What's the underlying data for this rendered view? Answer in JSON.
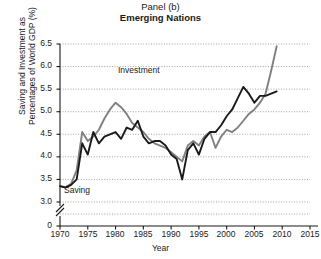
{
  "title": {
    "panel": "Panel (b)",
    "subtitle": "Emerging Nations"
  },
  "axes": {
    "ylabel_line1": "Saving and Investment as",
    "ylabel_line2": "Percentages of World GDP (%)",
    "xlabel": "Year",
    "yticks": [
      "6.5",
      "6.0",
      "5.5",
      "5.0",
      "4.5",
      "4.0",
      "3.5",
      "3.0",
      "0"
    ],
    "xticks": [
      "1970",
      "1975",
      "1980",
      "1985",
      "1990",
      "1995",
      "2000",
      "2005",
      "2010",
      "2015"
    ],
    "axis_break": true
  },
  "series_labels": {
    "investment": "Investment",
    "saving": "Saving"
  },
  "colors": {
    "saving": "#1a1a1a",
    "investment": "#808080",
    "grid": "#999999",
    "axis": "#1a1a1a",
    "background": "#ffffff"
  },
  "chart_data": {
    "type": "line",
    "title": "Panel (b) Emerging Nations",
    "xlabel": "Year",
    "ylabel": "Saving and Investment as Percentages of World GDP (%)",
    "xlim": [
      1970,
      2015
    ],
    "ylim": [
      3.0,
      6.5
    ],
    "ytick_values": [
      3.0,
      3.5,
      4.0,
      4.5,
      5.0,
      5.5,
      6.0,
      6.5
    ],
    "xtick_values": [
      1970,
      1975,
      1980,
      1985,
      1990,
      1995,
      2000,
      2005,
      2010,
      2015
    ],
    "grid": "horizontal-dotted",
    "legend": "inline-annotations",
    "axis_break_below": 3.0,
    "x": [
      1970,
      1971,
      1972,
      1973,
      1974,
      1975,
      1976,
      1977,
      1978,
      1979,
      1980,
      1981,
      1982,
      1983,
      1984,
      1985,
      1986,
      1987,
      1988,
      1989,
      1990,
      1991,
      1992,
      1993,
      1994,
      1995,
      1996,
      1997,
      1998,
      1999,
      2000,
      2001,
      2002,
      2003,
      2004,
      2005,
      2006,
      2007,
      2008,
      2009
    ],
    "series": [
      {
        "name": "Saving",
        "color": "#1a1a1a",
        "values": [
          3.35,
          3.32,
          3.38,
          3.5,
          4.3,
          4.05,
          4.55,
          4.3,
          4.45,
          4.5,
          4.55,
          4.4,
          4.65,
          4.6,
          4.8,
          4.45,
          4.3,
          4.35,
          4.35,
          4.25,
          4.05,
          3.95,
          3.5,
          4.15,
          4.3,
          4.05,
          4.4,
          4.55,
          4.55,
          4.7,
          4.9,
          5.05,
          5.3,
          5.55,
          5.4,
          5.2,
          5.35,
          5.35,
          5.4,
          5.45
        ]
      },
      {
        "name": "Investment",
        "color": "#808080",
        "values": [
          3.35,
          3.33,
          3.4,
          3.7,
          4.55,
          4.35,
          4.45,
          4.6,
          4.85,
          5.05,
          5.2,
          5.1,
          4.95,
          4.75,
          4.65,
          4.55,
          4.4,
          4.3,
          4.25,
          4.2,
          4.1,
          4.0,
          3.9,
          4.25,
          4.35,
          4.25,
          4.45,
          4.55,
          4.2,
          4.45,
          4.6,
          4.55,
          4.65,
          4.8,
          4.95,
          5.05,
          5.2,
          5.4,
          5.9,
          6.45
        ]
      }
    ]
  },
  "geometry": {
    "plot_left": 60,
    "plot_right": 310,
    "plot_top": 44,
    "plot_bottom": 202,
    "axis_bottom": 226,
    "x_start_value": 1970,
    "x_end_value": 2015,
    "y_top_value": 6.5,
    "y_bottom_value": 3.0
  }
}
